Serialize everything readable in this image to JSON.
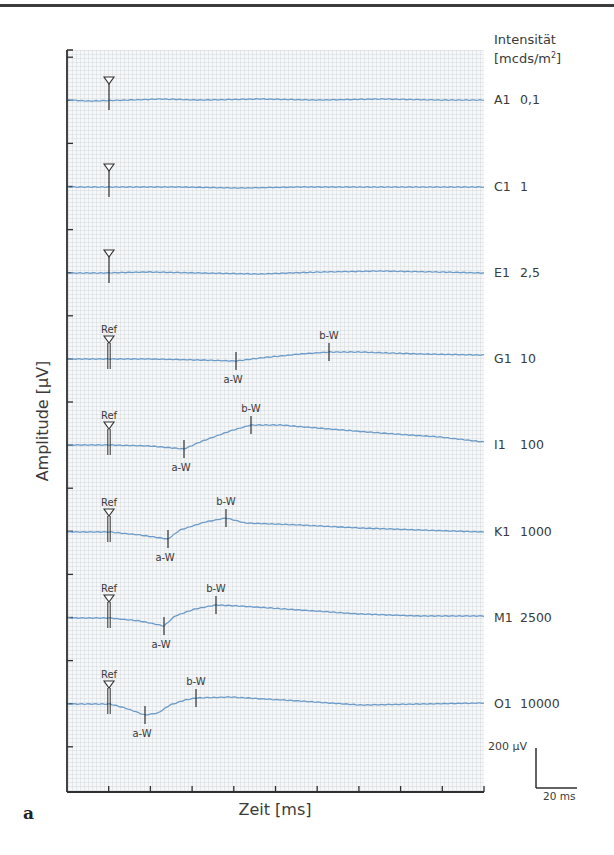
{
  "chart_data": {
    "type": "line",
    "title": "",
    "panel_label": "a",
    "xlabel": "Zeit [ms]",
    "ylabel": "Amplitude [µV]",
    "legend_title": "Intensität [mcds/m²]",
    "legend_title_line1": "Intensität",
    "legend_title_line2_pre": "[mcds/m",
    "legend_title_line2_sup": "2",
    "legend_title_line2_post": "]",
    "scale_bar": {
      "amplitude": "200 µV",
      "time": "20 ms"
    },
    "x_ticks_count": 10,
    "grid": true,
    "colors": {
      "trace": "#6b9bc8",
      "axis": "#2f2f2f",
      "grid": "#c8cdd4",
      "background": "#f6f7f8"
    },
    "series": [
      {
        "name": "A1",
        "intensity": "0,1",
        "ref_marker": true,
        "ref_label": "",
        "a_wave": null,
        "b_wave": null,
        "baseline_y": 100,
        "points": [
          [
            68,
            100
          ],
          [
            90,
            101
          ],
          [
            130,
            100
          ],
          [
            160,
            99
          ],
          [
            200,
            100
          ],
          [
            260,
            99
          ],
          [
            320,
            100
          ],
          [
            380,
            99
          ],
          [
            440,
            100
          ],
          [
            484,
            100
          ]
        ]
      },
      {
        "name": "C1",
        "intensity": "1",
        "ref_marker": true,
        "ref_label": "",
        "a_wave": null,
        "b_wave": null,
        "baseline_y": 187,
        "points": [
          [
            68,
            187
          ],
          [
            120,
            187
          ],
          [
            180,
            187
          ],
          [
            240,
            188
          ],
          [
            300,
            187
          ],
          [
            360,
            187
          ],
          [
            420,
            187
          ],
          [
            484,
            187
          ]
        ]
      },
      {
        "name": "E1",
        "intensity": "2,5",
        "ref_marker": true,
        "ref_label": "",
        "a_wave": null,
        "b_wave": null,
        "baseline_y": 273,
        "points": [
          [
            68,
            273
          ],
          [
            100,
            273
          ],
          [
            150,
            272
          ],
          [
            200,
            273
          ],
          [
            260,
            274
          ],
          [
            320,
            272
          ],
          [
            380,
            271
          ],
          [
            440,
            272
          ],
          [
            484,
            273
          ]
        ]
      },
      {
        "name": "G1",
        "intensity": "10",
        "ref_marker": true,
        "ref_label": "Ref",
        "a_wave": {
          "label": "a-W",
          "x": 236
        },
        "b_wave": {
          "label": "b-W",
          "x": 329
        },
        "baseline_y": 359,
        "points": [
          [
            68,
            359
          ],
          [
            110,
            359
          ],
          [
            150,
            359
          ],
          [
            200,
            360
          ],
          [
            236,
            361
          ],
          [
            260,
            358
          ],
          [
            300,
            354
          ],
          [
            329,
            352
          ],
          [
            360,
            352
          ],
          [
            420,
            354
          ],
          [
            484,
            355
          ]
        ]
      },
      {
        "name": "I1",
        "intensity": "100",
        "ref_marker": true,
        "ref_label": "Ref",
        "a_wave": {
          "label": "a-W",
          "x": 184
        },
        "b_wave": {
          "label": "b-W",
          "x": 251
        },
        "baseline_y": 445,
        "points": [
          [
            68,
            445
          ],
          [
            110,
            445
          ],
          [
            150,
            446
          ],
          [
            184,
            449
          ],
          [
            200,
            442
          ],
          [
            230,
            431
          ],
          [
            251,
            425
          ],
          [
            280,
            425
          ],
          [
            330,
            429
          ],
          [
            380,
            433
          ],
          [
            440,
            437
          ],
          [
            484,
            442
          ]
        ]
      },
      {
        "name": "K1",
        "intensity": "1000",
        "ref_marker": true,
        "ref_label": "Ref",
        "a_wave": {
          "label": "a-W",
          "x": 168
        },
        "b_wave": {
          "label": "b-W",
          "x": 226
        },
        "baseline_y": 532,
        "points": [
          [
            68,
            532
          ],
          [
            110,
            532
          ],
          [
            140,
            535
          ],
          [
            168,
            539
          ],
          [
            180,
            530
          ],
          [
            205,
            522
          ],
          [
            226,
            518
          ],
          [
            245,
            523
          ],
          [
            300,
            525
          ],
          [
            360,
            528
          ],
          [
            420,
            530
          ],
          [
            484,
            532
          ]
        ]
      },
      {
        "name": "M1",
        "intensity": "2500",
        "ref_marker": true,
        "ref_label": "Ref",
        "a_wave": {
          "label": "a-W",
          "x": 164
        },
        "b_wave": {
          "label": "b-W",
          "x": 216
        },
        "baseline_y": 618,
        "points": [
          [
            68,
            618
          ],
          [
            110,
            618
          ],
          [
            140,
            621
          ],
          [
            164,
            626
          ],
          [
            175,
            616
          ],
          [
            195,
            609
          ],
          [
            216,
            605
          ],
          [
            240,
            606
          ],
          [
            300,
            610
          ],
          [
            360,
            614
          ],
          [
            420,
            616
          ],
          [
            484,
            616
          ]
        ]
      },
      {
        "name": "O1",
        "intensity": "10000",
        "ref_marker": true,
        "ref_label": "Ref",
        "a_wave": {
          "label": "a-W",
          "x": 145
        },
        "b_wave": {
          "label": "b-W",
          "x": 196
        },
        "baseline_y": 704,
        "points": [
          [
            68,
            704
          ],
          [
            110,
            704
          ],
          [
            125,
            708
          ],
          [
            145,
            715
          ],
          [
            158,
            713
          ],
          [
            170,
            705
          ],
          [
            185,
            700
          ],
          [
            196,
            698
          ],
          [
            230,
            697
          ],
          [
            300,
            701
          ],
          [
            360,
            705
          ],
          [
            420,
            704
          ],
          [
            484,
            703
          ]
        ]
      }
    ]
  }
}
